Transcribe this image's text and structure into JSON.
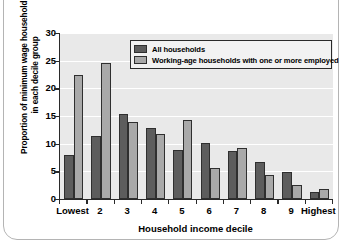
{
  "chart_data": {
    "type": "bar",
    "title": "",
    "xlabel": "Household income decile",
    "ylabel": "Proportion of minimum wage households in each decile group",
    "ylabel_line1": "Proportion of minimum wage households",
    "ylabel_line2": "in each decile group",
    "categories": [
      "Lowest",
      "2",
      "3",
      "4",
      "5",
      "6",
      "7",
      "8",
      "9",
      "Highest"
    ],
    "series": [
      {
        "name": "All households",
        "color": "#5d5d5d",
        "values": [
          7.9,
          11.3,
          15.4,
          12.9,
          8.9,
          10.1,
          8.7,
          6.6,
          4.8,
          1.3
        ]
      },
      {
        "name": "Working-age households with one or more employed",
        "color": "#a9a9a9",
        "values": [
          22.4,
          24.5,
          14.0,
          11.7,
          14.3,
          5.6,
          9.2,
          4.3,
          2.6,
          1.9
        ]
      }
    ],
    "ylim": [
      0,
      30
    ],
    "yticks": [
      0,
      5,
      10,
      15,
      20,
      25,
      30
    ],
    "ytick_labels": [
      "0",
      "5",
      "10",
      "15",
      "20",
      "25",
      "30"
    ],
    "grid": true,
    "grid_color": "#ffffff",
    "plot_background": "#e9e9e9",
    "legend_position": "top-right-inside"
  }
}
